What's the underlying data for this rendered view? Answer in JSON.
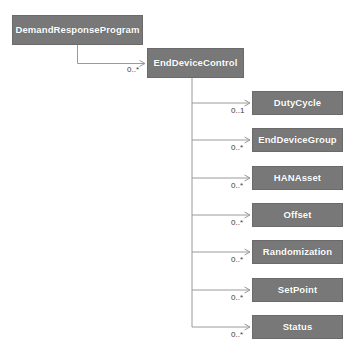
{
  "diagram": {
    "type": "uml-class-association-diagram",
    "canvas": {
      "width": 355,
      "height": 356,
      "background": "#ffffff"
    },
    "style": {
      "box_fill": "#787878",
      "box_border": "#6a6a6a",
      "box_text_color": "#ffffff",
      "edge_color": "#9a9a9a",
      "label_color": "#3a3a3a"
    },
    "nodes": [
      {
        "id": "demand-response-program",
        "label": "DemandResponseProgram",
        "x": 12,
        "y": 15,
        "w": 131,
        "h": 30
      },
      {
        "id": "end-device-control",
        "label": "EndDeviceControl",
        "x": 147,
        "y": 48,
        "w": 97,
        "h": 30
      },
      {
        "id": "duty-cycle",
        "label": "DutyCycle",
        "x": 252,
        "y": 91,
        "w": 91,
        "h": 24
      },
      {
        "id": "end-device-group",
        "label": "EndDeviceGroup",
        "x": 252,
        "y": 128,
        "w": 91,
        "h": 24
      },
      {
        "id": "hana-asset",
        "label": "HANAsset",
        "x": 252,
        "y": 166,
        "w": 91,
        "h": 24
      },
      {
        "id": "offset",
        "label": "Offset",
        "x": 252,
        "y": 203,
        "w": 91,
        "h": 24
      },
      {
        "id": "randomization",
        "label": "Randomization",
        "x": 252,
        "y": 240,
        "w": 91,
        "h": 24
      },
      {
        "id": "set-point",
        "label": "SetPoint",
        "x": 252,
        "y": 278,
        "w": 91,
        "h": 24
      },
      {
        "id": "status",
        "label": "Status",
        "x": 252,
        "y": 315,
        "w": 91,
        "h": 24
      }
    ],
    "edges": [
      {
        "id": "edge-drp-edc",
        "from": "demand-response-program",
        "to": "end-device-control",
        "multiplicity": "0..*",
        "label_x": 127,
        "label_y": 66,
        "path": "M 77.5 45 L 77.5 63.5 L 145 63.5",
        "arrow": "M 145 63.5 L 139.5 60.5 M 145 63.5 L 139.5 66.5"
      },
      {
        "id": "edge-edc-duty-cycle",
        "from": "end-device-control",
        "to": "duty-cycle",
        "multiplicity": "0..1",
        "label_x": 231,
        "label_y": 107,
        "path": "M 192 78 L 192 103 L 250 103",
        "arrow": "M 250 103 L 244.5 100 M 250 103 L 244.5 106"
      },
      {
        "id": "edge-edc-end-device-group",
        "from": "end-device-control",
        "to": "end-device-group",
        "multiplicity": "0..*",
        "label_x": 231,
        "label_y": 144,
        "path": "M 192 103 L 192 140 L 250 140",
        "arrow": "M 250 140 L 244.5 137 M 250 140 L 244.5 143"
      },
      {
        "id": "edge-edc-hana-asset",
        "from": "end-device-control",
        "to": "hana-asset",
        "multiplicity": "0..*",
        "label_x": 231,
        "label_y": 182,
        "path": "M 192 140 L 192 178 L 250 178",
        "arrow": "M 250 178 L 244.5 175 M 250 178 L 244.5 181"
      },
      {
        "id": "edge-edc-offset",
        "from": "end-device-control",
        "to": "offset",
        "multiplicity": "0..*",
        "label_x": 231,
        "label_y": 219,
        "path": "M 192 178 L 192 215 L 250 215",
        "arrow": "M 250 215 L 244.5 212 M 250 215 L 244.5 218"
      },
      {
        "id": "edge-edc-randomization",
        "from": "end-device-control",
        "to": "randomization",
        "multiplicity": "0..*",
        "label_x": 231,
        "label_y": 256,
        "path": "M 192 215 L 192 252 L 250 252",
        "arrow": "M 250 252 L 244.5 249 M 250 252 L 244.5 255"
      },
      {
        "id": "edge-edc-set-point",
        "from": "end-device-control",
        "to": "set-point",
        "multiplicity": "0..*",
        "label_x": 231,
        "label_y": 294,
        "path": "M 192 252 L 192 290 L 250 290",
        "arrow": "M 250 290 L 244.5 287 M 250 290 L 244.5 293"
      },
      {
        "id": "edge-edc-status",
        "from": "end-device-control",
        "to": "status",
        "multiplicity": "0..*",
        "label_x": 231,
        "label_y": 331,
        "path": "M 192 290 L 192 327 L 250 327",
        "arrow": "M 250 327 L 244.5 324 M 250 327 L 244.5 330"
      }
    ]
  }
}
